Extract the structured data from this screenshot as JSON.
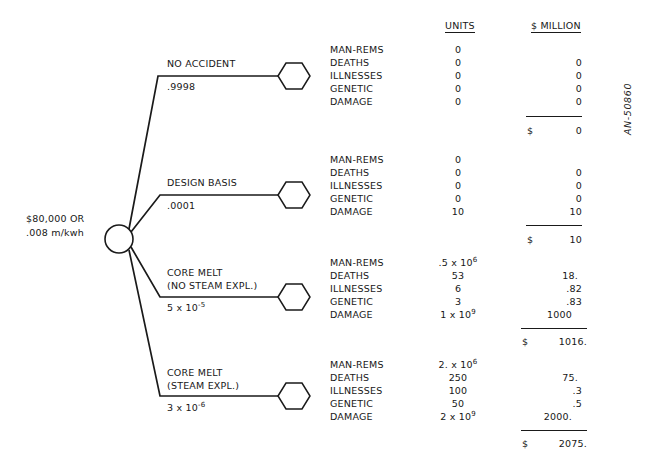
{
  "figure": {
    "reference_code": "AN-50860",
    "root": {
      "label_line1": "$80,000 OR",
      "label_line2": ".008 m/kwh"
    },
    "columns": {
      "units_header": "UNITS",
      "money_header": "$ MILLION",
      "currency_symbol": "$"
    },
    "row_labels": [
      "MAN-REMS",
      "DEATHS",
      "ILLNESSES",
      "GENETIC",
      "DAMAGE"
    ],
    "branches": [
      {
        "name": "NO ACCIDENT",
        "name_line2": "",
        "probability": ".9998",
        "prob_mantissa": "",
        "prob_base": "",
        "prob_exp": "",
        "units": [
          {
            "label": "MAN-REMS",
            "value": "0",
            "exp": ""
          },
          {
            "label": "DEATHS",
            "value": "0",
            "exp": ""
          },
          {
            "label": "ILLNESSES",
            "value": "0",
            "exp": ""
          },
          {
            "label": "GENETIC",
            "value": "0",
            "exp": ""
          },
          {
            "label": "DAMAGE",
            "value": "0",
            "exp": ""
          }
        ],
        "money": [
          "",
          "0",
          "0",
          "0",
          "0"
        ],
        "total": "0"
      },
      {
        "name": "DESIGN BASIS",
        "name_line2": "",
        "probability": ".0001",
        "prob_mantissa": "",
        "prob_base": "",
        "prob_exp": "",
        "units": [
          {
            "label": "MAN-REMS",
            "value": "0",
            "exp": ""
          },
          {
            "label": "DEATHS",
            "value": "0",
            "exp": ""
          },
          {
            "label": "ILLNESSES",
            "value": "0",
            "exp": ""
          },
          {
            "label": "GENETIC",
            "value": "0",
            "exp": ""
          },
          {
            "label": "DAMAGE",
            "value": "10",
            "exp": ""
          }
        ],
        "money": [
          "",
          "0",
          "0",
          "0",
          "10"
        ],
        "total": "10"
      },
      {
        "name": "CORE MELT",
        "name_line2": "(NO STEAM EXPL.)",
        "probability": "",
        "prob_mantissa": "5 x 10",
        "prob_base": "",
        "prob_exp": "-5",
        "units": [
          {
            "label": "MAN-REMS",
            "value": ".5 x 10",
            "exp": "6"
          },
          {
            "label": "DEATHS",
            "value": "53",
            "exp": ""
          },
          {
            "label": "ILLNESSES",
            "value": "6",
            "exp": ""
          },
          {
            "label": "GENETIC",
            "value": "3",
            "exp": ""
          },
          {
            "label": "DAMAGE",
            "value": "1 x 10",
            "exp": "9"
          }
        ],
        "money": [
          "",
          "18.",
          ".82",
          ".83",
          "1000"
        ],
        "total": "1016."
      },
      {
        "name": "CORE MELT",
        "name_line2": "(STEAM EXPL.)",
        "probability": "",
        "prob_mantissa": "3 x 10",
        "prob_base": "",
        "prob_exp": "-6",
        "units": [
          {
            "label": "MAN-REMS",
            "value": "2. x 10",
            "exp": "6"
          },
          {
            "label": "DEATHS",
            "value": "250",
            "exp": ""
          },
          {
            "label": "ILLNESSES",
            "value": "100",
            "exp": ""
          },
          {
            "label": "GENETIC",
            "value": "50",
            "exp": ""
          },
          {
            "label": "DAMAGE",
            "value": "2 x 10",
            "exp": "9"
          }
        ],
        "money": [
          "",
          "75.",
          ".3",
          ".5",
          "2000."
        ],
        "total": "2075."
      }
    ]
  },
  "colors": {
    "ink": "#1a1a1a",
    "paper": "#ffffff"
  }
}
